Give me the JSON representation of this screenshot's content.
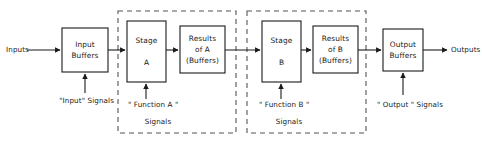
{
  "diagram": {
    "colors": {
      "background": "#ffffff",
      "stroke": "#1a1a1a",
      "dashed_stroke": "#555555",
      "text": "#1a1a1a"
    },
    "boxes": [
      {
        "id": "input-buffers",
        "name": "input-buffers-box",
        "label": "Input\nBuffers",
        "x": 62,
        "y": 28,
        "w": 46,
        "h": 44
      },
      {
        "id": "stage-a",
        "name": "stage-a-box",
        "label": "Stage\n\nA",
        "x": 127,
        "y": 21,
        "w": 39,
        "h": 61
      },
      {
        "id": "results-a",
        "name": "results-of-a-box",
        "label": "Results\nof A\n(Buffers)",
        "x": 180,
        "y": 26,
        "w": 45,
        "h": 47
      },
      {
        "id": "stage-b",
        "name": "stage-b-box",
        "label": "Stage\n\nB",
        "x": 262,
        "y": 21,
        "w": 39,
        "h": 61
      },
      {
        "id": "results-b",
        "name": "results-of-b-box",
        "label": "Results\nof B\n(Buffers)",
        "x": 313,
        "y": 26,
        "w": 45,
        "h": 47
      },
      {
        "id": "output-buffers",
        "name": "output-buffers-box",
        "label": "Output\nBuffers",
        "x": 383,
        "y": 29,
        "w": 40,
        "h": 42
      }
    ],
    "dashed_groups": [
      {
        "id": "function-a-group",
        "name": "function-a-dashed-group",
        "x": 118,
        "y": 11,
        "w": 118,
        "h": 122
      },
      {
        "id": "function-b-group",
        "name": "function-b-dashed-group",
        "x": 247,
        "y": 11,
        "w": 119,
        "h": 122
      }
    ],
    "labels": {
      "inputs": "Inputs",
      "outputs": "Outputs",
      "input_signals": "\"Input\" Signals",
      "function_a_signals_line1": "\" Function A \"",
      "function_a_signals_line2": "Signals",
      "function_b_signals_line1": "\" Function B \"",
      "function_b_signals_line2": "Signals",
      "output_signals": "\" Output \" Signals"
    }
  }
}
